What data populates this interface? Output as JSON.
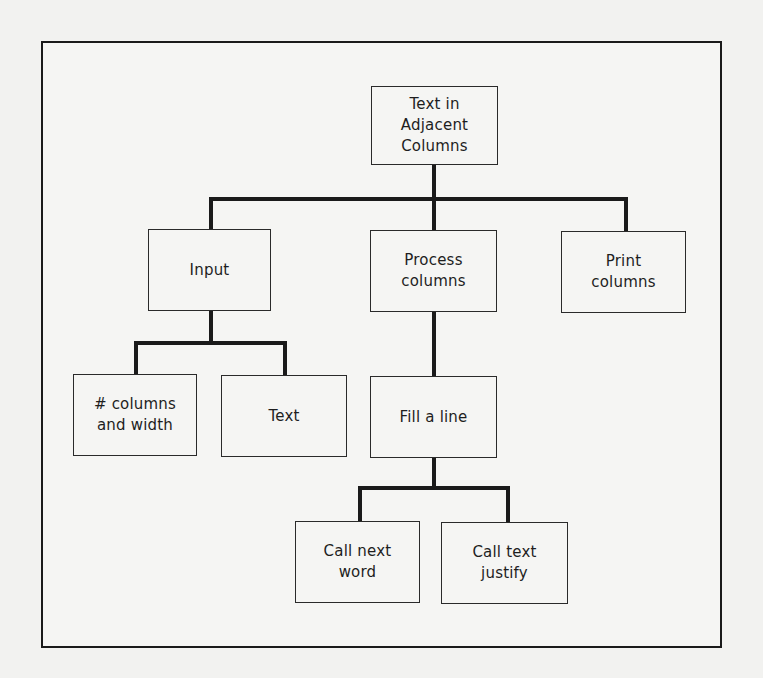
{
  "diagram": {
    "type": "hierarchy-chart",
    "root": {
      "id": "root",
      "label": "Text in\nAdjacent\nColumns"
    },
    "nodes": [
      {
        "id": "root",
        "label": "Text in\nAdjacent\nColumns",
        "parent": null
      },
      {
        "id": "input",
        "label": "Input",
        "parent": "root"
      },
      {
        "id": "process",
        "label": "Process\ncolumns",
        "parent": "root"
      },
      {
        "id": "print",
        "label": "Print\ncolumns",
        "parent": "root"
      },
      {
        "id": "columns_width",
        "label": "# columns\nand width",
        "parent": "input"
      },
      {
        "id": "text",
        "label": "Text",
        "parent": "input"
      },
      {
        "id": "fill_line",
        "label": "Fill a line",
        "parent": "process"
      },
      {
        "id": "next_word",
        "label": "Call next\nword",
        "parent": "fill_line"
      },
      {
        "id": "text_justify",
        "label": "Call text\njustify",
        "parent": "fill_line"
      }
    ],
    "colors": {
      "background": "#f2f2f0",
      "line": "#1a1a1a",
      "text": "#1e1e1e"
    }
  }
}
